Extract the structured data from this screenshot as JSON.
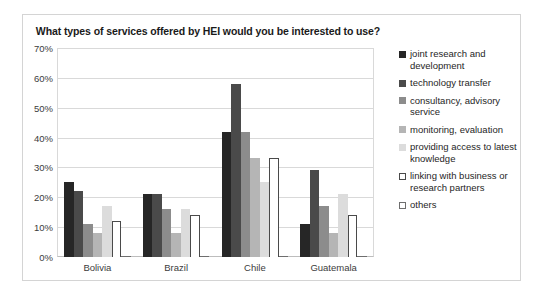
{
  "chart_data": {
    "type": "bar",
    "title": "What types of services offered by HEI would you be interested to use?",
    "xlabel": "",
    "ylabel": "",
    "categories": [
      "Bolivia",
      "Brazil",
      "Chile",
      "Guatemala"
    ],
    "ylim": [
      0,
      70
    ],
    "ytick_labels": [
      "0%",
      "10%",
      "20%",
      "30%",
      "40%",
      "50%",
      "60%",
      "70%"
    ],
    "ytick_values": [
      0,
      10,
      20,
      30,
      40,
      50,
      60,
      70
    ],
    "grid": true,
    "legend_position": "right",
    "series": [
      {
        "name": "joint research and development",
        "color": "#262626",
        "border": "#262626",
        "values": [
          25,
          21,
          42,
          11
        ]
      },
      {
        "name": "technology transfer",
        "color": "#4a4a4a",
        "border": "#4a4a4a",
        "values": [
          22,
          21,
          58,
          29
        ]
      },
      {
        "name": "consultancy, advisory service",
        "color": "#8c8c8c",
        "border": "#8c8c8c",
        "values": [
          11,
          16,
          42,
          17
        ]
      },
      {
        "name": "monitoring, evaluation",
        "color": "#b5b5b5",
        "border": "#b5b5b5",
        "values": [
          8,
          8,
          33,
          8
        ]
      },
      {
        "name": "providing access to latest knowledge",
        "color": "#dcdcdc",
        "border": "#dcdcdc",
        "values": [
          17,
          16,
          25,
          21
        ]
      },
      {
        "name": "linking with business or research partners",
        "color": "#ffffff",
        "border": "#4a4a4a",
        "values": [
          12,
          14,
          33,
          14
        ]
      },
      {
        "name": "others",
        "color": "#ffffff",
        "border": "#6e6e6e",
        "values": [
          0,
          0,
          0,
          0
        ]
      }
    ]
  }
}
